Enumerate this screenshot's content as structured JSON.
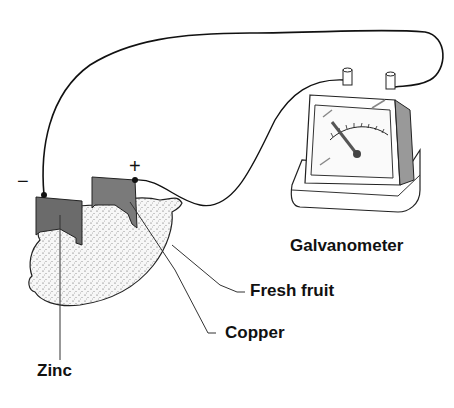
{
  "diagram": {
    "labels": {
      "galvanometer": "Galvanometer",
      "fresh_fruit": "Fresh fruit",
      "copper": "Copper",
      "zinc": "Zinc"
    },
    "signs": {
      "negative": "−",
      "positive": "+"
    },
    "colors": {
      "line": "#111111",
      "electrode": "#6b6b6b",
      "fruit_fill": "#f4f4f4",
      "background": "#ffffff"
    }
  }
}
